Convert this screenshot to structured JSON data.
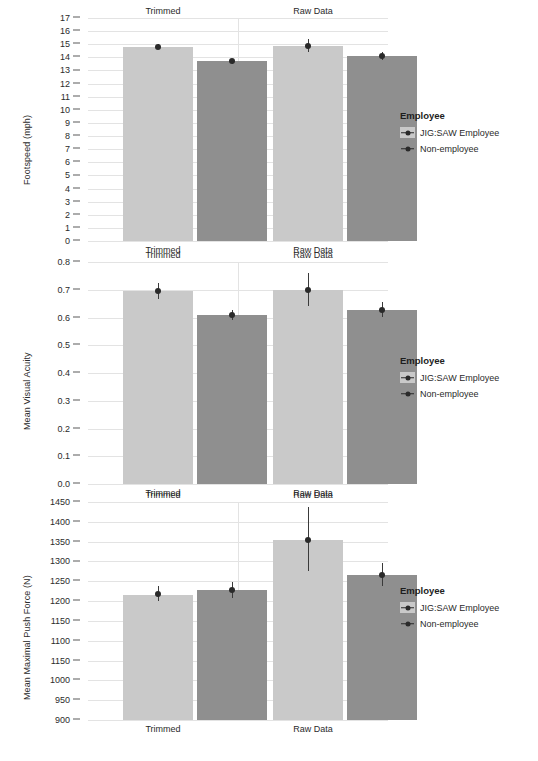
{
  "legend": {
    "title": "Employee",
    "items": [
      {
        "label": "JIG:SAW Employee",
        "color": "#c9c9c9",
        "key": "pointrange-key-icon"
      },
      {
        "label": "Non-employee",
        "color": "#8f8f8f",
        "key": "pointrange-key-icon"
      }
    ]
  },
  "facets": [
    "Trimmed",
    "Raw Data"
  ],
  "chart_data": [
    {
      "type": "bar",
      "title": "",
      "ylabel": "Footspeed (mph)",
      "xlabel": "",
      "ylim": [
        0,
        17
      ],
      "ytick_labels": [
        "17",
        "16",
        "15",
        "14",
        "13",
        "12",
        "11",
        "10",
        "9",
        "8",
        "7",
        "6",
        "5",
        "4",
        "3",
        "2",
        "1",
        "0"
      ],
      "ytick_values": [
        17,
        16,
        15,
        14,
        13,
        12,
        11,
        10,
        9,
        8,
        7,
        6,
        5,
        4,
        3,
        2,
        1,
        0
      ],
      "grid": true,
      "legend_position": "right",
      "facets": [
        "Trimmed",
        "Raw Data"
      ],
      "categories": [
        "Trimmed",
        "Raw Data"
      ],
      "series": [
        {
          "name": "JIG:SAW Employee",
          "color": "#c9c9c9",
          "values": [
            14.8,
            14.9
          ],
          "err_low": [
            14.6,
            14.4
          ],
          "err_high": [
            15.0,
            15.4
          ]
        },
        {
          "name": "Non-employee",
          "color": "#8f8f8f",
          "values": [
            13.7,
            14.1
          ],
          "err_low": [
            13.5,
            13.8
          ],
          "err_high": [
            13.9,
            14.4
          ]
        }
      ]
    },
    {
      "type": "bar",
      "title": "",
      "ylabel": "Mean Visual Acuity",
      "xlabel": "",
      "ylim": [
        0.0,
        0.8
      ],
      "ytick_labels": [
        "0.8",
        "0.7",
        "0.6",
        "0.5",
        "0.4",
        "0.3",
        "0.2",
        "0.1",
        "0.0"
      ],
      "ytick_values": [
        0.8,
        0.7,
        0.6,
        0.5,
        0.4,
        0.3,
        0.2,
        0.1,
        0.0
      ],
      "grid": true,
      "legend_position": "right",
      "facets": [
        "Trimmed",
        "Raw Data"
      ],
      "categories": [
        "Trimmed",
        "Raw Data"
      ],
      "series": [
        {
          "name": "JIG:SAW Employee",
          "color": "#c9c9c9",
          "values": [
            0.695,
            0.7
          ],
          "err_low": [
            0.665,
            0.64
          ],
          "err_high": [
            0.725,
            0.762
          ]
        },
        {
          "name": "Non-employee",
          "color": "#8f8f8f",
          "values": [
            0.608,
            0.627
          ],
          "err_low": [
            0.59,
            0.6
          ],
          "err_high": [
            0.626,
            0.656
          ]
        }
      ]
    },
    {
      "type": "bar",
      "title": "",
      "ylabel": "Mean Maximal Push Force (N)",
      "xlabel": "",
      "ylim": [
        900,
        1450
      ],
      "ytick_labels": [
        "1450",
        "1400",
        "1350",
        "1300",
        "1250",
        "1200",
        "1150",
        "1100",
        "1150",
        "1000",
        "950",
        "900"
      ],
      "ytick_values": [
        1450,
        1400,
        1350,
        1300,
        1250,
        1200,
        1150,
        1100,
        1050,
        1000,
        950,
        900
      ],
      "grid": true,
      "legend_position": "right",
      "facets": [
        "Trimmed",
        "Raw Data"
      ],
      "categories": [
        "Trimmed",
        "Raw Data"
      ],
      "series": [
        {
          "name": "JIG:SAW Employee",
          "color": "#c9c9c9",
          "values": [
            1218,
            1355
          ],
          "err_low": [
            1200,
            1277
          ],
          "err_high": [
            1238,
            1437
          ],
          "bar_tops": [
            1215,
            1355
          ]
        },
        {
          "name": "Non-employee",
          "color": "#8f8f8f",
          "values": [
            1228,
            1265
          ],
          "err_low": [
            1209,
            1238
          ],
          "err_high": [
            1247,
            1295
          ],
          "bar_tops": [
            1227,
            1265
          ]
        }
      ]
    }
  ]
}
